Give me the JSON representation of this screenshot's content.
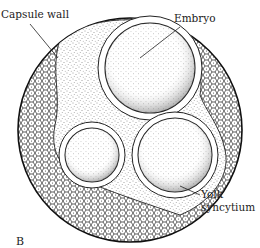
{
  "figure": {
    "panel_label": "B",
    "labels": {
      "capsule_wall": "Capsule wall",
      "embryo": "Embryo",
      "yolk_line1": "Yolk",
      "yolk_line2": "syncytium"
    }
  }
}
